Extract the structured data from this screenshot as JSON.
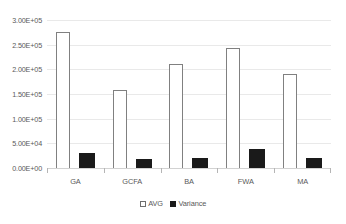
{
  "chart_data": {
    "type": "bar",
    "title": "",
    "subtitle": "",
    "xlabel": "",
    "ylabel": "",
    "categories": [
      "GA",
      "GCFA",
      "BA",
      "FWA",
      "MA"
    ],
    "series": [
      {
        "name": "AVG",
        "values": [
          275000,
          158000,
          210000,
          243000,
          190000
        ],
        "fill": "#ffffff",
        "border": "#808080"
      },
      {
        "name": "Variance",
        "values": [
          31000,
          19000,
          21000,
          39000,
          21000
        ],
        "fill": "#1a1a1a",
        "border": "#1a1a1a"
      }
    ],
    "ylim": [
      0,
      300000
    ],
    "ytick_values": [
      0,
      50000,
      100000,
      150000,
      200000,
      250000,
      300000
    ],
    "ytick_labels": [
      "0.00E+00",
      "5.00E+04",
      "1.00E+05",
      "1.50E+05",
      "2.00E+05",
      "2.50E+05",
      "3.00E+05"
    ],
    "grid": true,
    "grid_color": "#e9e9e9",
    "axis_color": "#d2d2d2",
    "legend_position": "bottom",
    "legend_entries": [
      "AVG",
      "Variance"
    ],
    "background": "#ffffff",
    "text_color": "#595959"
  }
}
